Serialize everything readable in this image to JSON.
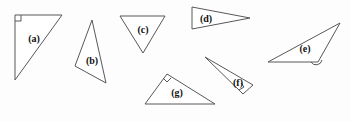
{
  "figure": {
    "background_color": "#fdfdfd",
    "stroke_color": "#58585a",
    "fill_color": "#ffffff",
    "label_color": "#111111",
    "width": 351,
    "height": 122
  },
  "triangles": [
    {
      "id": "a",
      "label": "(a)",
      "description": "right triangle, right angle at top-left vertex",
      "points": "15,15 62,15 15,80",
      "label_x": 34,
      "label_y": 38,
      "mark": {
        "type": "square",
        "points": "15,21 21,21 21,15"
      }
    },
    {
      "id": "b",
      "label": "(b)",
      "description": "scalene triangle, apex at top",
      "points": "92,20 75,66 106,83",
      "label_x": 92,
      "label_y": 60,
      "mark": null
    },
    {
      "id": "c",
      "label": "(c)",
      "description": "inverted triangle pointing down",
      "points": "120,16 165,16 143,53",
      "label_x": 143,
      "label_y": 29,
      "mark": null
    },
    {
      "id": "d",
      "label": "(d)",
      "description": "thin wedge pointing right",
      "points": "192,7 250,18 192,29",
      "label_x": 206,
      "label_y": 18,
      "mark": null
    },
    {
      "id": "e",
      "label": "(e)",
      "description": "obtuse triangle with angle arc at bottom-right vertex",
      "points": "268,62 340,23 318,62",
      "label_x": 305,
      "label_y": 48,
      "mark": {
        "type": "arc",
        "path": "M 311,62 A 6,6 0 0 0 322,60"
      }
    },
    {
      "id": "f",
      "label": "(f)",
      "description": "narrow wedge pointing upper-left, right angle at bottom vertex",
      "points": "205,57 253,85 243,94",
      "label_x": 238,
      "label_y": 82,
      "mark": {
        "type": "square",
        "points": "239,90 244,87 241,83"
      }
    },
    {
      "id": "g",
      "label": "(g)",
      "description": "right triangle, right angle at top vertex",
      "points": "145,104 167,74 215,104",
      "label_x": 177,
      "label_y": 92,
      "mark": {
        "type": "square",
        "points": "163,78 167,82 171,78"
      }
    }
  ]
}
